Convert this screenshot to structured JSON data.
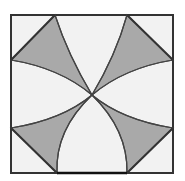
{
  "diagram": {
    "type": "geometric-figure",
    "colors": {
      "background": "#ffffff",
      "fill_light": "#f2f2f2",
      "fill_shaded": "#a9a9a9",
      "stroke": "#3a3a3a"
    },
    "square": {
      "x1": 10,
      "y1": 15,
      "x2": 173,
      "y2": 173
    },
    "shaded_regions": 4
  }
}
